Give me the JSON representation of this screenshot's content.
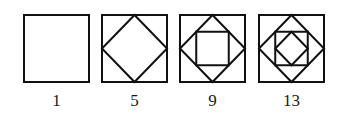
{
  "figure": {
    "stroke_color": "#111111",
    "panels": [
      {
        "label": "1",
        "levels": 1
      },
      {
        "label": "5",
        "levels": 2
      },
      {
        "label": "9",
        "levels": 3
      },
      {
        "label": "13",
        "levels": 4
      }
    ]
  }
}
